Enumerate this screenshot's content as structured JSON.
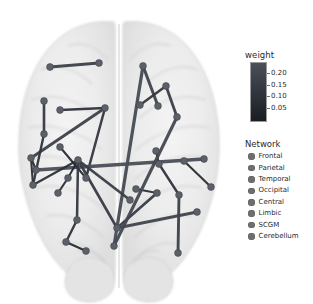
{
  "figure": {
    "type": "brain-connectome-axial",
    "background": "#ffffff",
    "brain_template_color": "#e9e9e9",
    "view": "axial-superior"
  },
  "colorbar": {
    "title": "weight",
    "ticks": [
      "0.20",
      "0.15",
      "0.10",
      "0.05"
    ],
    "vmin": 0.05,
    "vmax": 0.2,
    "low_color": "#1a1d22",
    "high_color": "#4a4f58"
  },
  "legend": {
    "title": "Network",
    "items": [
      {
        "label": "Frontal",
        "color": "#6e6e6e"
      },
      {
        "label": "Parietal",
        "color": "#6e6e6e"
      },
      {
        "label": "Temporal",
        "color": "#6e6e6e"
      },
      {
        "label": "Occipital",
        "color": "#6e6e6e"
      },
      {
        "label": "Central",
        "color": "#6e6e6e"
      },
      {
        "label": "Limbic",
        "color": "#6e6e6e"
      },
      {
        "label": "SCGM",
        "color": "#6e6e6e"
      },
      {
        "label": "Cerebellum",
        "color": "#6e6e6e"
      }
    ]
  },
  "chart_data": {
    "type": "scatter",
    "title": "",
    "xlabel": "",
    "ylabel": "",
    "xlim": [
      0,
      238
    ],
    "ylim": [
      0,
      304
    ],
    "grid": false,
    "legend_position": "right",
    "colorbar_label": "weight",
    "colorbar_range": [
      0.05,
      0.2
    ],
    "nodes": [
      {
        "id": 0,
        "x": 50,
        "y": 67,
        "network": "Frontal"
      },
      {
        "id": 1,
        "x": 99,
        "y": 63,
        "network": "Frontal"
      },
      {
        "id": 2,
        "x": 143,
        "y": 66,
        "network": "Frontal"
      },
      {
        "id": 3,
        "x": 166,
        "y": 86,
        "network": "Frontal"
      },
      {
        "id": 4,
        "x": 158,
        "y": 106,
        "network": "Frontal"
      },
      {
        "id": 5,
        "x": 177,
        "y": 117,
        "network": "Frontal"
      },
      {
        "id": 6,
        "x": 140,
        "y": 105,
        "network": "Frontal"
      },
      {
        "id": 7,
        "x": 44,
        "y": 101,
        "network": "Frontal"
      },
      {
        "id": 8,
        "x": 60,
        "y": 110,
        "network": "Frontal"
      },
      {
        "id": 9,
        "x": 105,
        "y": 108,
        "network": "Central"
      },
      {
        "id": 10,
        "x": 44,
        "y": 134,
        "network": "Central"
      },
      {
        "id": 11,
        "x": 31,
        "y": 158,
        "network": "Temporal"
      },
      {
        "id": 12,
        "x": 36,
        "y": 170,
        "network": "Temporal"
      },
      {
        "id": 13,
        "x": 33,
        "y": 185,
        "network": "Temporal"
      },
      {
        "id": 14,
        "x": 60,
        "y": 147,
        "network": "Central"
      },
      {
        "id": 15,
        "x": 68,
        "y": 178,
        "network": "Limbic"
      },
      {
        "id": 16,
        "x": 78,
        "y": 160,
        "network": "Central"
      },
      {
        "id": 17,
        "x": 86,
        "y": 178,
        "network": "Limbic"
      },
      {
        "id": 18,
        "x": 156,
        "y": 151,
        "network": "Central"
      },
      {
        "id": 19,
        "x": 159,
        "y": 164,
        "network": "Central"
      },
      {
        "id": 20,
        "x": 184,
        "y": 161,
        "network": "Parietal"
      },
      {
        "id": 21,
        "x": 204,
        "y": 159,
        "network": "Parietal"
      },
      {
        "id": 22,
        "x": 179,
        "y": 195,
        "network": "Parietal"
      },
      {
        "id": 23,
        "x": 211,
        "y": 187,
        "network": "Occipital"
      },
      {
        "id": 24,
        "x": 136,
        "y": 189,
        "network": "Limbic"
      },
      {
        "id": 25,
        "x": 130,
        "y": 200,
        "network": "Limbic"
      },
      {
        "id": 26,
        "x": 157,
        "y": 193,
        "network": "Limbic"
      },
      {
        "id": 27,
        "x": 77,
        "y": 220,
        "network": "Occipital"
      },
      {
        "id": 28,
        "x": 66,
        "y": 242,
        "network": "Occipital"
      },
      {
        "id": 29,
        "x": 86,
        "y": 251,
        "network": "Occipital"
      },
      {
        "id": 30,
        "x": 114,
        "y": 246,
        "network": "Occipital"
      },
      {
        "id": 31,
        "x": 117,
        "y": 228,
        "network": "Occipital"
      },
      {
        "id": 32,
        "x": 178,
        "y": 253,
        "network": "Cerebellum"
      },
      {
        "id": 33,
        "x": 197,
        "y": 212,
        "network": "Cerebellum"
      },
      {
        "id": 34,
        "x": 58,
        "y": 193,
        "network": "SCGM"
      }
    ],
    "edges": [
      {
        "source": 0,
        "target": 1,
        "weight": 0.16
      },
      {
        "source": 2,
        "target": 4,
        "weight": 0.17
      },
      {
        "source": 3,
        "target": 5,
        "weight": 0.15
      },
      {
        "source": 3,
        "target": 6,
        "weight": 0.13
      },
      {
        "source": 2,
        "target": 30,
        "weight": 0.19
      },
      {
        "source": 7,
        "target": 10,
        "weight": 0.14
      },
      {
        "source": 8,
        "target": 9,
        "weight": 0.12
      },
      {
        "source": 9,
        "target": 11,
        "weight": 0.16
      },
      {
        "source": 9,
        "target": 17,
        "weight": 0.13
      },
      {
        "source": 11,
        "target": 12,
        "weight": 0.11
      },
      {
        "source": 11,
        "target": 13,
        "weight": 0.1
      },
      {
        "source": 10,
        "target": 13,
        "weight": 0.12
      },
      {
        "source": 12,
        "target": 21,
        "weight": 0.2
      },
      {
        "source": 13,
        "target": 16,
        "weight": 0.11
      },
      {
        "source": 14,
        "target": 17,
        "weight": 0.09
      },
      {
        "source": 15,
        "target": 16,
        "weight": 0.08
      },
      {
        "source": 16,
        "target": 25,
        "weight": 0.15
      },
      {
        "source": 16,
        "target": 27,
        "weight": 0.13
      },
      {
        "source": 16,
        "target": 31,
        "weight": 0.14
      },
      {
        "source": 18,
        "target": 19,
        "weight": 0.09
      },
      {
        "source": 19,
        "target": 22,
        "weight": 0.12
      },
      {
        "source": 20,
        "target": 23,
        "weight": 0.1
      },
      {
        "source": 22,
        "target": 32,
        "weight": 0.16
      },
      {
        "source": 24,
        "target": 26,
        "weight": 0.11
      },
      {
        "source": 26,
        "target": 31,
        "weight": 0.14
      },
      {
        "source": 31,
        "target": 33,
        "weight": 0.17
      },
      {
        "source": 27,
        "target": 28,
        "weight": 0.12
      },
      {
        "source": 28,
        "target": 29,
        "weight": 0.09
      },
      {
        "source": 34,
        "target": 15,
        "weight": 0.1
      },
      {
        "source": 5,
        "target": 30,
        "weight": 0.18
      }
    ]
  }
}
